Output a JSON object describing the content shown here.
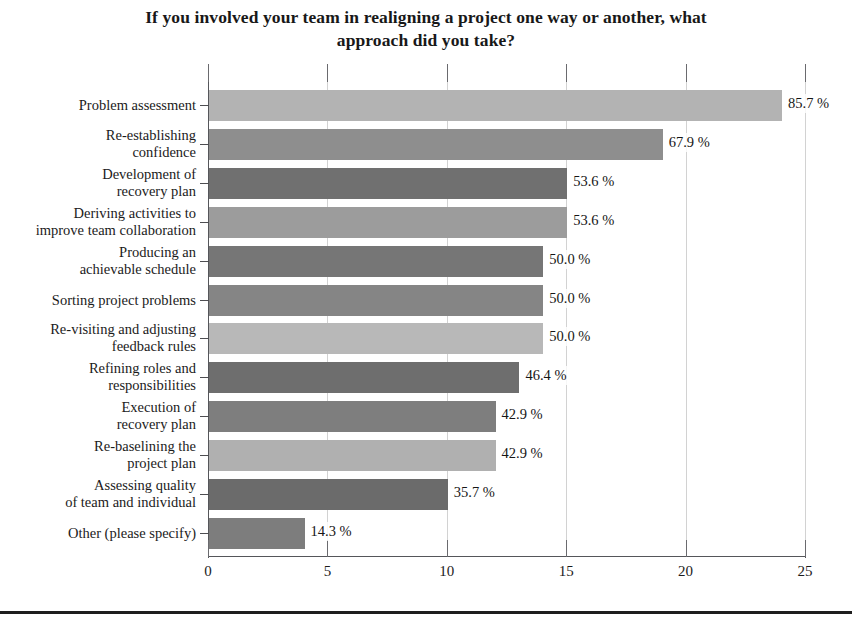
{
  "chart_data": {
    "type": "bar",
    "orientation": "horizontal",
    "title": "If you involved your team in realigning a project one way or another, what approach did you take?",
    "xlabel": "",
    "ylabel": "",
    "xlim": [
      0,
      25
    ],
    "xticks": [
      "0",
      "5",
      "10",
      "15",
      "20",
      "25"
    ],
    "grid": true,
    "legend": "none",
    "categories": [
      "Problem assessment",
      "Re-establishing confidence",
      "Development of recovery plan",
      "Deriving activities to improve team collaboration",
      "Producing an achievable schedule",
      "Sorting project problems",
      "Re-visiting and adjusting feedback rules",
      "Refining roles and responsibilities",
      "Execution of recovery plan",
      "Re-baselining the project plan",
      "Assessing quality of team and individual",
      "Other (please specify)"
    ],
    "values": [
      24.0,
      19.0,
      15.0,
      15.0,
      14.0,
      14.0,
      14.0,
      13.0,
      12.0,
      12.0,
      10.0,
      4.0
    ],
    "data_labels": [
      "85.7 %",
      "67.9 %",
      "53.6 %",
      "53.6 %",
      "50.0 %",
      "50.0 %",
      "50.0 %",
      "46.4 %",
      "42.9 %",
      "42.9 %",
      "35.7 %",
      "14.3 %"
    ],
    "bar_colors": [
      "#b3b3b3",
      "#8e8e8e",
      "#707070",
      "#9c9c9c",
      "#767676",
      "#858585",
      "#b8b8b8",
      "#6e6e6e",
      "#7e7e7e",
      "#b0b0b0",
      "#6b6b6b",
      "#7d7d7d"
    ]
  },
  "rows": [
    {
      "label_line1": "Problem assessment",
      "label_line2": "",
      "value": 24.0,
      "data_label": "85.7 %",
      "color": "#b3b3b3"
    },
    {
      "label_line1": "Re-establishing",
      "label_line2": "confidence",
      "value": 19.0,
      "data_label": "67.9 %",
      "color": "#8e8e8e"
    },
    {
      "label_line1": "Development of",
      "label_line2": "recovery plan",
      "value": 15.0,
      "data_label": "53.6 %",
      "color": "#707070"
    },
    {
      "label_line1": "Deriving activities to",
      "label_line2": "improve team collaboration",
      "value": 15.0,
      "data_label": "53.6 %",
      "color": "#9c9c9c"
    },
    {
      "label_line1": "Producing an",
      "label_line2": "achievable schedule",
      "value": 14.0,
      "data_label": "50.0 %",
      "color": "#767676"
    },
    {
      "label_line1": "Sorting project problems",
      "label_line2": "",
      "value": 14.0,
      "data_label": "50.0 %",
      "color": "#858585"
    },
    {
      "label_line1": "Re-visiting and adjusting",
      "label_line2": "feedback rules",
      "value": 14.0,
      "data_label": "50.0 %",
      "color": "#b8b8b8"
    },
    {
      "label_line1": "Refining roles and",
      "label_line2": "responsibilities",
      "value": 13.0,
      "data_label": "46.4 %",
      "color": "#6e6e6e"
    },
    {
      "label_line1": "Execution of",
      "label_line2": "recovery plan",
      "value": 12.0,
      "data_label": "42.9 %",
      "color": "#7e7e7e"
    },
    {
      "label_line1": "Re-baselining the",
      "label_line2": "project plan",
      "value": 12.0,
      "data_label": "42.9 %",
      "color": "#b0b0b0"
    },
    {
      "label_line1": "Assessing quality",
      "label_line2": "of team and individual",
      "value": 10.0,
      "data_label": "35.7 %",
      "color": "#6b6b6b"
    },
    {
      "label_line1": "Other (please specify)",
      "label_line2": "",
      "value": 4.0,
      "data_label": "14.3 %",
      "color": "#7d7d7d"
    }
  ],
  "axis": {
    "xticks": [
      "0",
      "5",
      "10",
      "15",
      "20",
      "25"
    ]
  }
}
